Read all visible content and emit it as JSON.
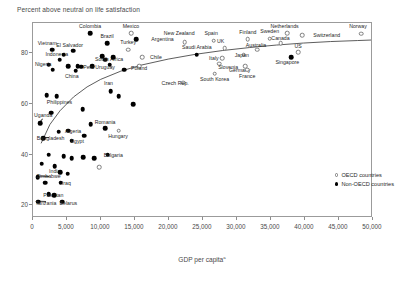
{
  "chart_data": {
    "type": "scatter",
    "title": "Percent above neutral on life satisfaction",
    "xlabel": "GDP per capita",
    "xlabel_superscript": "a",
    "ylabel": "",
    "xlim": [
      0,
      50000
    ],
    "ylim": [
      15,
      92
    ],
    "xticks": [
      "0",
      "5,000",
      "10,000",
      "15,000",
      "20,000",
      "25,000",
      "30,000",
      "35,000",
      "40,000",
      "45,000",
      "50,000"
    ],
    "xtick_values": [
      0,
      5000,
      10000,
      15000,
      20000,
      25000,
      30000,
      35000,
      40000,
      45000,
      50000
    ],
    "yticks": [
      "20",
      "40",
      "60",
      "80"
    ],
    "ytick_values": [
      20,
      40,
      60,
      80
    ],
    "grid": false,
    "legend_position": "bottom-right",
    "legend": [
      {
        "label": "OECD countries",
        "marker": "open-circle",
        "color": "#ffffff",
        "border": "#7d7d7d"
      },
      {
        "label": "Non-OECD countries",
        "marker": "filled-circle",
        "color": "#000000"
      }
    ],
    "trendline": {
      "label": "logarithmic fit",
      "color": "#333333",
      "points": [
        [
          1200,
          44.0
        ],
        [
          2500,
          51.5
        ],
        [
          4000,
          57.0
        ],
        [
          6000,
          62.5
        ],
        [
          8000,
          66.5
        ],
        [
          10000,
          69.5
        ],
        [
          13000,
          72.8
        ],
        [
          16000,
          75.2
        ],
        [
          20000,
          77.6
        ],
        [
          24000,
          79.5
        ],
        [
          28000,
          81.0
        ],
        [
          32000,
          82.2
        ],
        [
          36000,
          83.2
        ],
        [
          40000,
          84.0
        ],
        [
          44000,
          84.6
        ],
        [
          48000,
          85.0
        ],
        [
          50000,
          85.2
        ]
      ]
    },
    "points": [
      {
        "name": "Colombia",
        "x": 8400,
        "y": 88.0,
        "group": "nonoecd",
        "lx": 8400,
        "ly": 91.0,
        "anchor": "center"
      },
      {
        "name": "Mexico",
        "x": 14400,
        "y": 88.0,
        "group": "oecd",
        "lx": 14400,
        "ly": 91.0,
        "anchor": "center"
      },
      {
        "name": "Argentina",
        "x": 15200,
        "y": 85.5,
        "group": "nonoecd",
        "lx": 17400,
        "ly": 85.5,
        "anchor": "left"
      },
      {
        "name": "Brazil",
        "x": 10900,
        "y": 84.0,
        "group": "nonoecd",
        "lx": 10900,
        "ly": 87.0,
        "anchor": "center"
      },
      {
        "name": "Vietnam",
        "x": 2800,
        "y": 81.5,
        "group": "nonoecd",
        "lx": 2100,
        "ly": 84.0,
        "anchor": "center"
      },
      {
        "name": "El Salvador",
        "x": 5900,
        "y": 81.0,
        "group": "nonoecd",
        "lx": 5400,
        "ly": 83.5,
        "anchor": "center"
      },
      {
        "name": "Turkey",
        "x": 14000,
        "y": 81.5,
        "group": "oecd",
        "lx": 14000,
        "ly": 84.5,
        "anchor": "center"
      },
      {
        "name": "Chile",
        "x": 16100,
        "y": 78.5,
        "group": "oecd",
        "lx": 17200,
        "ly": 78.5,
        "anchor": "left"
      },
      {
        "name": "Indonesia",
        "x": 3900,
        "y": 77.5,
        "group": "nonoecd",
        "lx": 3500,
        "ly": 79.8,
        "anchor": "center"
      },
      {
        "name": "South Africa",
        "x": 10600,
        "y": 77.5,
        "group": "nonoecd",
        "lx": 11200,
        "ly": 77.8,
        "anchor": "center"
      },
      {
        "name": "Nigeria",
        "x": 2300,
        "y": 75.5,
        "group": "nonoecd",
        "lx": 1500,
        "ly": 76.0,
        "anchor": "center"
      },
      {
        "name": "Peru",
        "x": 8700,
        "y": 75.0,
        "group": "nonoecd",
        "lx": 8200,
        "ly": 74.5,
        "anchor": "center"
      },
      {
        "name": "Uruguay",
        "x": 11300,
        "y": 75.5,
        "group": "nonoecd",
        "lx": 10600,
        "ly": 74.5,
        "anchor": "center"
      },
      {
        "name": "Poland",
        "x": 15600,
        "y": 75.0,
        "group": "oecd",
        "lx": 15600,
        "ly": 74.2,
        "anchor": "center"
      },
      {
        "name": "China",
        "x": 6300,
        "y": 73.2,
        "group": "nonoecd",
        "lx": 5700,
        "ly": 71.0,
        "anchor": "center"
      },
      {
        "name": "Saudi Arabia",
        "x": 24100,
        "y": 79.5,
        "group": "nonoecd",
        "lx": 24100,
        "ly": 82.5,
        "anchor": "center"
      },
      {
        "name": "Slovenia",
        "x": 27400,
        "y": 76.0,
        "group": "oecd",
        "lx": 28700,
        "ly": 74.5,
        "anchor": "center"
      },
      {
        "name": "South Korea",
        "x": 26700,
        "y": 72.0,
        "group": "oecd",
        "lx": 26700,
        "ly": 70.0,
        "anchor": "center"
      },
      {
        "name": "New Zealand",
        "x": 22300,
        "y": 84.5,
        "group": "oecd",
        "lx": 21500,
        "ly": 88.0,
        "anchor": "center"
      },
      {
        "name": "Spain",
        "x": 26600,
        "y": 85.0,
        "group": "oecd",
        "lx": 26200,
        "ly": 88.0,
        "anchor": "center"
      },
      {
        "name": "UK",
        "x": 28200,
        "y": 82.0,
        "group": "oecd",
        "lx": 27600,
        "ly": 85.0,
        "anchor": "center"
      },
      {
        "name": "Finland",
        "x": 31600,
        "y": 85.5,
        "group": "oecd",
        "lx": 31600,
        "ly": 88.5,
        "anchor": "center"
      },
      {
        "name": "Sweden",
        "x": 34800,
        "y": 85.8,
        "group": "oecd",
        "lx": 34800,
        "ly": 88.8,
        "anchor": "center"
      },
      {
        "name": "Netherlands",
        "x": 37400,
        "y": 88.0,
        "group": "oecd",
        "lx": 37000,
        "ly": 91.0,
        "anchor": "center"
      },
      {
        "name": "Switzerland",
        "x": 39600,
        "y": 87.2,
        "group": "oecd",
        "lx": 41200,
        "ly": 87.2,
        "anchor": "left"
      },
      {
        "name": "Norway",
        "x": 48300,
        "y": 87.8,
        "group": "oecd",
        "lx": 47800,
        "ly": 91.0,
        "anchor": "center"
      },
      {
        "name": "Canada",
        "x": 36400,
        "y": 84.0,
        "group": "oecd",
        "lx": 36400,
        "ly": 86.2,
        "anchor": "center"
      },
      {
        "name": "Australia",
        "x": 33000,
        "y": 81.5,
        "group": "oecd",
        "lx": 32800,
        "ly": 83.5,
        "anchor": "center"
      },
      {
        "name": "US",
        "x": 39000,
        "y": 80.5,
        "group": "oecd",
        "lx": 39000,
        "ly": 83.0,
        "anchor": "center"
      },
      {
        "name": "Singapore",
        "x": 38000,
        "y": 78.5,
        "group": "nonoecd",
        "lx": 37400,
        "ly": 76.5,
        "anchor": "center"
      },
      {
        "name": "Italy",
        "x": 27800,
        "y": 78.0,
        "group": "oecd",
        "lx": 26600,
        "ly": 78.2,
        "anchor": "center"
      },
      {
        "name": "Germany",
        "x": 31200,
        "y": 75.0,
        "group": "oecd",
        "lx": 30400,
        "ly": 73.5,
        "anchor": "center"
      },
      {
        "name": "Japan",
        "x": 31000,
        "y": 79.5,
        "group": "oecd",
        "lx": 30700,
        "ly": 79.5,
        "anchor": "center"
      },
      {
        "name": "France",
        "x": 31500,
        "y": 73.5,
        "group": "oecd",
        "lx": 31500,
        "ly": 71.2,
        "anchor": "center"
      },
      {
        "name": "Czech Rep.",
        "x": 22100,
        "y": 68.5,
        "group": "oecd",
        "lx": 20900,
        "ly": 68.5,
        "anchor": "center"
      },
      {
        "name": "Iran",
        "x": 11400,
        "y": 65.0,
        "group": "nonoecd",
        "lx": 11100,
        "ly": 68.5,
        "anchor": "center"
      },
      {
        "name": "Philippines",
        "x": 3500,
        "y": 63.0,
        "group": "nonoecd",
        "lx": 3900,
        "ly": 61.0,
        "anchor": "center"
      },
      {
        "name": "Uganda",
        "x": 1100,
        "y": 52.5,
        "group": "nonoecd",
        "lx": 1500,
        "ly": 55.5,
        "anchor": "center"
      },
      {
        "name": "Bangladesh",
        "x": 1500,
        "y": 46.5,
        "group": "nonoecd",
        "lx": 2600,
        "ly": 46.5,
        "anchor": "center"
      },
      {
        "name": "Nigeria2",
        "x": 5200,
        "y": 49.5,
        "group": "nonoecd",
        "lx": 5900,
        "ly": 49.5,
        "anchor": "center"
      },
      {
        "name": "Egypt",
        "x": 5700,
        "y": 45.5,
        "group": "nonoecd",
        "lx": 6500,
        "ly": 45.5,
        "anchor": "center"
      },
      {
        "name": "Romania",
        "x": 10600,
        "y": 50.5,
        "group": "nonoecd",
        "lx": 10600,
        "ly": 53.0,
        "anchor": "center"
      },
      {
        "name": "Hungary",
        "x": 12600,
        "y": 49.5,
        "group": "oecd",
        "lx": 12500,
        "ly": 47.5,
        "anchor": "center"
      },
      {
        "name": "Bulgaria",
        "x": 11000,
        "y": 40.0,
        "group": "nonoecd",
        "lx": 11800,
        "ly": 40.0,
        "anchor": "center"
      },
      {
        "name": "India",
        "x": 3200,
        "y": 35.5,
        "group": "nonoecd",
        "lx": 3200,
        "ly": 33.5,
        "anchor": "center"
      },
      {
        "name": "Zimbabwe",
        "x": 700,
        "y": 31.0,
        "group": "nonoecd",
        "lx": 2300,
        "ly": 31.5,
        "anchor": "center"
      },
      {
        "name": "Iraq",
        "x": 4100,
        "y": 29.0,
        "group": "nonoecd",
        "lx": 4900,
        "ly": 29.0,
        "anchor": "center"
      },
      {
        "name": "Pakistan",
        "x": 2300,
        "y": 24.5,
        "group": "nonoecd",
        "lx": 3000,
        "ly": 24.0,
        "anchor": "center"
      },
      {
        "name": "Tanzania",
        "x": 800,
        "y": 21.5,
        "group": "nonoecd",
        "lx": 1900,
        "ly": 21.0,
        "anchor": "center"
      },
      {
        "name": "Belarus",
        "x": 4300,
        "y": 21.5,
        "group": "nonoecd",
        "lx": 5200,
        "ly": 21.0,
        "anchor": "center"
      },
      {
        "name": "u1",
        "x": 4500,
        "y": 79.5,
        "group": "nonoecd",
        "lx": null,
        "ly": null
      },
      {
        "name": "u2",
        "x": 5200,
        "y": 75.0,
        "group": "nonoecd",
        "lx": null,
        "ly": null
      },
      {
        "name": "u3",
        "x": 6600,
        "y": 75.0,
        "group": "nonoecd",
        "lx": null,
        "ly": null
      },
      {
        "name": "u4",
        "x": 7100,
        "y": 74.8,
        "group": "nonoecd",
        "lx": null,
        "ly": null
      },
      {
        "name": "u5",
        "x": 2900,
        "y": 73.5,
        "group": "nonoecd",
        "lx": null,
        "ly": null
      },
      {
        "name": "u6",
        "x": 10200,
        "y": 79.0,
        "group": "nonoecd",
        "lx": null,
        "ly": null
      },
      {
        "name": "u7",
        "x": 11800,
        "y": 78.5,
        "group": "nonoecd",
        "lx": null,
        "ly": null
      },
      {
        "name": "u8",
        "x": 2000,
        "y": 63.5,
        "group": "nonoecd",
        "lx": null,
        "ly": null
      },
      {
        "name": "u9",
        "x": 12600,
        "y": 63.0,
        "group": "nonoecd",
        "lx": null,
        "ly": null
      },
      {
        "name": "u10",
        "x": 14700,
        "y": 60.0,
        "group": "nonoecd",
        "lx": null,
        "ly": null
      },
      {
        "name": "u11",
        "x": 7300,
        "y": 58.0,
        "group": "nonoecd",
        "lx": null,
        "ly": null
      },
      {
        "name": "u12",
        "x": 8500,
        "y": 52.0,
        "group": "nonoecd",
        "lx": null,
        "ly": null
      },
      {
        "name": "u13",
        "x": 2300,
        "y": 40.0,
        "group": "nonoecd",
        "lx": null,
        "ly": null
      },
      {
        "name": "u14",
        "x": 4500,
        "y": 39.5,
        "group": "nonoecd",
        "lx": null,
        "ly": null
      },
      {
        "name": "u15",
        "x": 5700,
        "y": 38.5,
        "group": "nonoecd",
        "lx": null,
        "ly": null
      },
      {
        "name": "u16",
        "x": 7400,
        "y": 39.0,
        "group": "nonoecd",
        "lx": null,
        "ly": null
      },
      {
        "name": "u17",
        "x": 9000,
        "y": 38.5,
        "group": "nonoecd",
        "lx": null,
        "ly": null
      },
      {
        "name": "u18",
        "x": 9700,
        "y": 35.0,
        "group": "oecd",
        "lx": null,
        "ly": null
      },
      {
        "name": "u19",
        "x": 1300,
        "y": 36.5,
        "group": "nonoecd",
        "lx": null,
        "ly": null
      },
      {
        "name": "u20",
        "x": 4000,
        "y": 33.0,
        "group": "nonoecd",
        "lx": null,
        "ly": null
      },
      {
        "name": "u21",
        "x": 5100,
        "y": 32.5,
        "group": "nonoecd",
        "lx": null,
        "ly": null
      },
      {
        "name": "u22",
        "x": 1800,
        "y": 29.0,
        "group": "nonoecd",
        "lx": null,
        "ly": null
      },
      {
        "name": "u23",
        "x": 3100,
        "y": 24.0,
        "group": "nonoecd",
        "lx": null,
        "ly": null
      },
      {
        "name": "u24",
        "x": 7500,
        "y": 47.5,
        "group": "nonoecd",
        "lx": null,
        "ly": null
      },
      {
        "name": "u25",
        "x": 2700,
        "y": 56.5,
        "group": "nonoecd",
        "lx": null,
        "ly": null
      },
      {
        "name": "u26",
        "x": 13400,
        "y": 73.5,
        "group": "nonoecd",
        "lx": null,
        "ly": null
      },
      {
        "name": "u27",
        "x": 3800,
        "y": 49.0,
        "group": "nonoecd",
        "lx": null,
        "ly": null
      }
    ],
    "leaders": [
      {
        "from_x": 1500,
        "from_y": 54.0,
        "to_x": 1150,
        "to_y": 52.8
      },
      {
        "from_x": 2400,
        "from_y": 46.5,
        "to_x": 1600,
        "to_y": 46.5
      },
      {
        "from_x": 2300,
        "from_y": 31.0,
        "to_x": 780,
        "to_y": 31.2
      },
      {
        "from_x": 1850,
        "from_y": 21.5,
        "to_x": 880,
        "to_y": 21.6
      }
    ]
  }
}
